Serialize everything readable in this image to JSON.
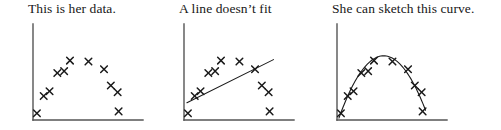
{
  "figure": {
    "title": "",
    "background": "#ffffff",
    "ink_color": "#1a1a1a",
    "axis_color": "#555555"
  },
  "panels": [
    {
      "id": "panel-data",
      "title": "This is her data.",
      "overlay": "none",
      "overlay_label": ""
    },
    {
      "id": "panel-line",
      "title": "A line doesn’t fit",
      "overlay": "line",
      "overlay_label": "fitted straight line"
    },
    {
      "id": "panel-curve",
      "title": "She can sketch this curve.",
      "overlay": "curve",
      "overlay_label": "sketched parabolic curve"
    }
  ],
  "chart_data": [
    {
      "type": "scatter",
      "title": "This is her data.",
      "xlabel": "",
      "ylabel": "",
      "xlim": [
        0,
        110
      ],
      "ylim": [
        0,
        96
      ],
      "grid": false,
      "legend": "none",
      "marker": "x",
      "axes": {
        "left": true,
        "bottom": true,
        "top": false,
        "right": false
      },
      "points": [
        {
          "x": 4,
          "y": 7
        },
        {
          "x": 11,
          "y": 25
        },
        {
          "x": 17,
          "y": 30
        },
        {
          "x": 25,
          "y": 49
        },
        {
          "x": 32,
          "y": 51
        },
        {
          "x": 38,
          "y": 62
        },
        {
          "x": 57,
          "y": 61
        },
        {
          "x": 73,
          "y": 53
        },
        {
          "x": 80,
          "y": 36
        },
        {
          "x": 87,
          "y": 29
        },
        {
          "x": 88,
          "y": 9
        }
      ],
      "overlay": {
        "type": "none"
      }
    },
    {
      "type": "scatter",
      "title": "A line doesn’t fit",
      "xlabel": "",
      "ylabel": "",
      "xlim": [
        0,
        110
      ],
      "ylim": [
        0,
        96
      ],
      "grid": false,
      "legend": "none",
      "marker": "x",
      "axes": {
        "left": true,
        "bottom": true,
        "top": false,
        "right": false
      },
      "points": [
        {
          "x": 4,
          "y": 7
        },
        {
          "x": 11,
          "y": 25
        },
        {
          "x": 17,
          "y": 30
        },
        {
          "x": 25,
          "y": 49
        },
        {
          "x": 32,
          "y": 51
        },
        {
          "x": 38,
          "y": 62
        },
        {
          "x": 57,
          "y": 61
        },
        {
          "x": 73,
          "y": 53
        },
        {
          "x": 80,
          "y": 36
        },
        {
          "x": 87,
          "y": 29
        },
        {
          "x": 88,
          "y": 9
        }
      ],
      "overlay": {
        "type": "line",
        "label": "fitted straight line",
        "from": {
          "x": 3,
          "y": 18
        },
        "to": {
          "x": 92,
          "y": 63
        }
      }
    },
    {
      "type": "scatter",
      "title": "She can sketch this curve.",
      "xlabel": "",
      "ylabel": "",
      "xlim": [
        0,
        110
      ],
      "ylim": [
        0,
        96
      ],
      "grid": false,
      "legend": "none",
      "marker": "x",
      "axes": {
        "left": true,
        "bottom": true,
        "top": false,
        "right": false
      },
      "points": [
        {
          "x": 4,
          "y": 7
        },
        {
          "x": 11,
          "y": 25
        },
        {
          "x": 17,
          "y": 30
        },
        {
          "x": 25,
          "y": 49
        },
        {
          "x": 32,
          "y": 51
        },
        {
          "x": 38,
          "y": 62
        },
        {
          "x": 57,
          "y": 61
        },
        {
          "x": 73,
          "y": 53
        },
        {
          "x": 80,
          "y": 36
        },
        {
          "x": 87,
          "y": 29
        },
        {
          "x": 88,
          "y": 9
        }
      ],
      "overlay": {
        "type": "curve",
        "label": "sketched parabolic curve",
        "shape": "parabola",
        "vertex": {
          "x": 48,
          "y": 67
        },
        "x_start": 2,
        "x_end": 91
      }
    }
  ]
}
